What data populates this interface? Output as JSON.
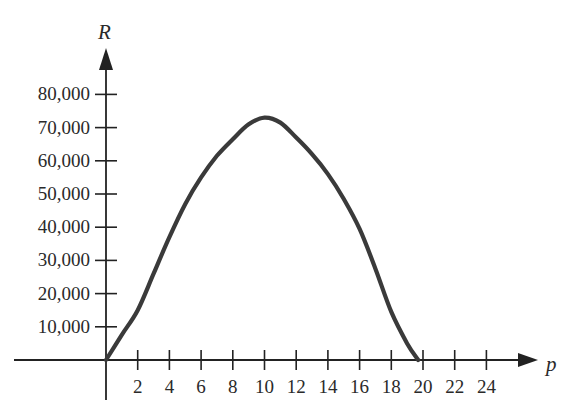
{
  "chart_data": {
    "type": "line",
    "title": "",
    "xlabel": "p",
    "ylabel": "R",
    "xlim": [
      0,
      25
    ],
    "ylim": [
      0,
      88000
    ],
    "grid": false,
    "legend": null,
    "x_ticks": [
      2,
      4,
      6,
      8,
      10,
      12,
      14,
      16,
      18,
      20,
      22,
      24
    ],
    "x_tick_labels": [
      "2",
      "4",
      "6",
      "8",
      "10",
      "12",
      "14",
      "16",
      "18",
      "20",
      "22",
      "24"
    ],
    "y_ticks": [
      10000,
      20000,
      30000,
      40000,
      50000,
      60000,
      70000,
      80000
    ],
    "y_tick_labels": [
      "10,000",
      "20,000",
      "30,000",
      "40,000",
      "50,000",
      "60,000",
      "70,000",
      "80,000"
    ],
    "series": [
      {
        "name": "R(p)",
        "color": "#3a3a3a",
        "x": [
          0,
          1,
          2,
          3,
          4,
          5,
          6,
          7,
          8,
          9,
          10,
          11,
          12,
          13,
          14,
          15,
          16,
          17,
          18,
          19,
          19.7
        ],
        "values": [
          0,
          7600,
          15000,
          26000,
          37000,
          47000,
          55000,
          61500,
          66500,
          71000,
          73000,
          71500,
          67000,
          62000,
          56000,
          48500,
          39500,
          27500,
          14500,
          5000,
          0
        ]
      }
    ]
  }
}
